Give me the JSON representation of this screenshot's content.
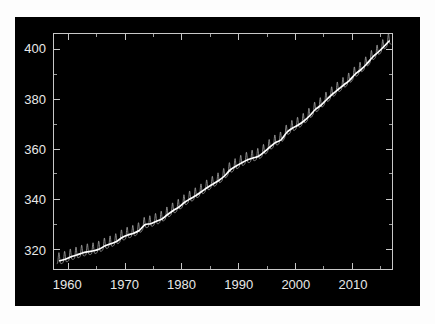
{
  "figure": {
    "background_color": "#000000",
    "page_background_color": "#fdfdfd",
    "axis_color": "#c8c8c8",
    "text_color": "#e8e8e8",
    "season_color": "#bdbdbd",
    "trend_color": "#ffffff"
  },
  "chart_data": {
    "type": "line",
    "title": "",
    "subtitle": "",
    "xlabel": "",
    "ylabel": "",
    "xlim": [
      1957.5,
      2017.0
    ],
    "ylim": [
      312.0,
      406.0
    ],
    "grid": false,
    "legend": null,
    "legend_position": "none",
    "x_ticks": [
      1960,
      1970,
      1980,
      1990,
      2000,
      2010
    ],
    "x_tick_labels": [
      "1960",
      "1970",
      "1980",
      "1990",
      "2000",
      "2010"
    ],
    "x_minor_ticks": [
      1965,
      1975,
      1985,
      1995,
      2005,
      2015
    ],
    "y_ticks": [
      320,
      340,
      360,
      380,
      400
    ],
    "y_tick_labels": [
      "320",
      "340",
      "360",
      "380",
      "400"
    ],
    "y_minor_ticks": [
      330,
      350,
      370,
      390
    ],
    "annotations": [],
    "series": [
      {
        "name": "Monthly mean CO2 (seasonal)",
        "style": "thin-line",
        "color": "#bdbdbd",
        "seasonal_amplitude_ppm": 3.2,
        "description": "Monthly atmospheric CO2 concentration showing annual sawtooth seasonal cycle"
      },
      {
        "name": "Trend (seasonally adjusted)",
        "style": "thick-line",
        "color": "#ffffff",
        "description": "Smoothed long-term trend of atmospheric CO2"
      }
    ],
    "x": [
      1958.5,
      1959.5,
      1960.5,
      1961.5,
      1962.5,
      1963.5,
      1964.5,
      1965.5,
      1966.5,
      1967.5,
      1968.5,
      1969.5,
      1970.5,
      1971.5,
      1972.5,
      1973.5,
      1974.5,
      1975.5,
      1976.5,
      1977.5,
      1978.5,
      1979.5,
      1980.5,
      1981.5,
      1982.5,
      1983.5,
      1984.5,
      1985.5,
      1986.5,
      1987.5,
      1988.5,
      1989.5,
      1990.5,
      1991.5,
      1992.5,
      1993.5,
      1994.5,
      1995.5,
      1996.5,
      1997.5,
      1998.5,
      1999.5,
      2000.5,
      2001.5,
      2002.5,
      2003.5,
      2004.5,
      2005.5,
      2006.5,
      2007.5,
      2008.5,
      2009.5,
      2010.5,
      2011.5,
      2012.5,
      2013.5,
      2014.5,
      2015.5,
      2016.5
    ],
    "values": [
      315.3,
      315.9,
      316.9,
      317.6,
      318.4,
      318.9,
      319.3,
      320.0,
      321.3,
      322.1,
      323.0,
      324.6,
      325.6,
      326.3,
      327.4,
      329.7,
      330.1,
      331.1,
      332.0,
      333.8,
      335.4,
      336.8,
      338.7,
      340.1,
      341.4,
      343.0,
      344.6,
      346.0,
      347.4,
      349.2,
      351.6,
      353.1,
      354.4,
      355.6,
      356.4,
      357.1,
      358.8,
      360.8,
      362.6,
      363.7,
      366.7,
      368.4,
      369.6,
      371.2,
      373.3,
      375.8,
      377.5,
      379.8,
      381.9,
      383.8,
      385.6,
      387.4,
      389.9,
      391.7,
      393.9,
      396.5,
      398.6,
      400.8,
      403.2
    ]
  },
  "axes": {
    "x_axis_name": "year-axis",
    "y_axis_name": "co2-concentration-axis"
  }
}
